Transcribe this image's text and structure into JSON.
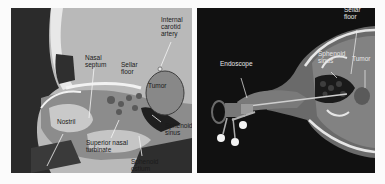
{
  "figure": {
    "panels": [
      {
        "id": "left",
        "view": "sagittal",
        "background": "#b9b9b9",
        "labels": [
          {
            "text": "Internal\ncarotid\nartery",
            "x": 150,
            "y": 8
          },
          {
            "text": "Nasal\nseptum",
            "x": 74,
            "y": 46
          },
          {
            "text": "Sellar\nfloor",
            "x": 110,
            "y": 53
          },
          {
            "text": "Tumor",
            "x": 137,
            "y": 74
          },
          {
            "text": "Nostril",
            "x": 46,
            "y": 110
          },
          {
            "text": "Sphenoid\nsinus",
            "x": 154,
            "y": 114
          },
          {
            "text": "Superior nasal\nturbinate",
            "x": 75,
            "y": 131
          },
          {
            "text": "Sphenoid\nostium",
            "x": 120,
            "y": 150
          }
        ]
      },
      {
        "id": "right",
        "view": "axial-3d",
        "background": "#111111",
        "labels": [
          {
            "text": "Sellar\nfloor",
            "x": 344,
            "y": 6
          },
          {
            "text": "Sphenoid\nsinus",
            "x": 318,
            "y": 50
          },
          {
            "text": "Tumor",
            "x": 352,
            "y": 55
          },
          {
            "text": "Endoscope",
            "x": 220,
            "y": 60
          }
        ]
      }
    ]
  }
}
